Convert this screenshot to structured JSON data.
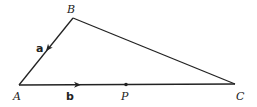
{
  "diagram": {
    "type": "triangle-vector-figure",
    "points": {
      "A": {
        "label": "A",
        "x": 19,
        "y": 85
      },
      "B": {
        "label": "B",
        "x": 73,
        "y": 18
      },
      "C": {
        "label": "C",
        "x": 235,
        "y": 84
      },
      "P": {
        "label": "P",
        "x": 126,
        "y": 84
      }
    },
    "vectors": {
      "a": {
        "label": "a",
        "from": "B",
        "to": "A"
      },
      "b": {
        "label": "b",
        "from": "A",
        "to": "C"
      }
    },
    "colors": {
      "stroke": "#222222",
      "background": "#ffffff"
    }
  }
}
